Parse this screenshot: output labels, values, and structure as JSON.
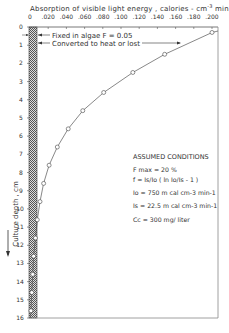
{
  "chart_data": {
    "type": "line",
    "xlabel": "Absorption of visible light energy , calories - cm-3 min-1",
    "ylabel": "Culture depth , cm",
    "x_ticks": [
      "0",
      ".020",
      ".040",
      ".060",
      ".080",
      ".100",
      ".120",
      ".140",
      ".160",
      ".180",
      ".200"
    ],
    "y_ticks": [
      "0",
      "1",
      "2",
      "3",
      "4",
      "5",
      "6",
      "7",
      "8",
      "9",
      "10",
      "11",
      "12",
      "13",
      "14",
      "15",
      "16"
    ],
    "xlim": [
      0,
      0.21
    ],
    "ylim": [
      0,
      16
    ],
    "y_inverted": true,
    "series": [
      {
        "name": "Converted to heat or lost",
        "x": [
          0.2,
          0.148,
          0.113,
          0.081,
          0.058,
          0.042,
          0.03,
          0.021,
          0.015,
          0.011,
          0.008,
          0.006,
          0.004,
          0.003,
          0.002,
          0.001,
          0.0005
        ],
        "y": [
          0.3,
          1.5,
          2.5,
          3.6,
          4.6,
          5.6,
          6.6,
          7.6,
          8.6,
          9.6,
          10.6,
          11.6,
          12.6,
          13.6,
          14.6,
          15.6,
          16.0
        ]
      },
      {
        "name": "Fixed in algae F = 0.05",
        "x": [
          0.008,
          0.008
        ],
        "y": [
          0,
          16
        ]
      }
    ],
    "annotations": [
      "Fixed in algae  F = 0.05",
      "Converted to heat or lost"
    ]
  },
  "labels": {
    "title": "Absorption  of  visible  light  energy ,  calories - cm",
    "title_sup1": "-3",
    "title_mid": " min",
    "title_sup2": "-1",
    "ylabel": "Culture depth , cm",
    "fixed": "Fixed  in  algae  F = 0.05",
    "converted": "Converted  to  heat  or  lost"
  },
  "conditions": {
    "heading": "ASSUMED  CONDITIONS",
    "fmax": "F max  =  20 %",
    "f_eq": "f  =  Is/Io  ( ln  Io/Is  - 1 )",
    "io": "Io  =  750 m cal  cm-3  min-1",
    "is": "Is  =  22.5 m cal  cm-3  min-1",
    "cc": "Cc  =  300 mg/ liter"
  }
}
